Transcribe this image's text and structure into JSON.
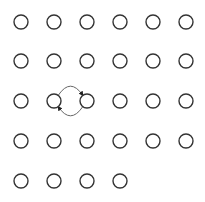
{
  "diagram": {
    "type": "node-grid-graph",
    "width": 205,
    "height": 202,
    "node_radius": 7,
    "node_stroke": "#333333",
    "node_fill": "#ffffff",
    "edge_color": "#666666",
    "columns_x": [
      21,
      54,
      87,
      120,
      153,
      186
    ],
    "rows_y": [
      22,
      61,
      101,
      141,
      181
    ],
    "rows": [
      {
        "count": 6
      },
      {
        "count": 6
      },
      {
        "count": 6
      },
      {
        "count": 6
      },
      {
        "count": 4
      }
    ],
    "edges": [
      {
        "from": [
          2,
          1
        ],
        "to": [
          2,
          2
        ],
        "curve": "upper",
        "arrow": "end"
      },
      {
        "from": [
          2,
          2
        ],
        "to": [
          2,
          1
        ],
        "curve": "lower",
        "arrow": "end"
      }
    ]
  }
}
